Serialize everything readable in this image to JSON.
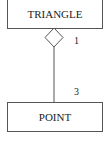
{
  "diagram": {
    "classes": [
      {
        "id": "triangle",
        "name": "TRIANGLE"
      },
      {
        "id": "point",
        "name": "POINT"
      }
    ],
    "association": {
      "type": "aggregation",
      "from": "TRIANGLE",
      "to": "POINT",
      "multiplicity_from": "1",
      "multiplicity_to": "3"
    }
  }
}
